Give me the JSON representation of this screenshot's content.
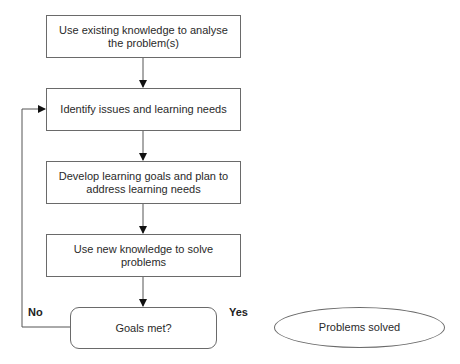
{
  "diagram": {
    "type": "flowchart",
    "nodes": [
      {
        "id": "n1",
        "shape": "rectangle",
        "text": "Use existing knowledge to analyse the problem(s)"
      },
      {
        "id": "n2",
        "shape": "rectangle",
        "text": "Identify issues and learning needs"
      },
      {
        "id": "n3",
        "shape": "rectangle",
        "text": "Develop learning goals and plan to address learning needs"
      },
      {
        "id": "n4",
        "shape": "rectangle",
        "text": "Use new knowledge to solve problems"
      },
      {
        "id": "n5",
        "shape": "rounded-rectangle",
        "text": "Goals met?"
      },
      {
        "id": "n6",
        "shape": "ellipse",
        "text": "Problems solved"
      }
    ],
    "edges": [
      {
        "from": "n1",
        "to": "n2"
      },
      {
        "from": "n2",
        "to": "n3"
      },
      {
        "from": "n3",
        "to": "n4"
      },
      {
        "from": "n4",
        "to": "n5"
      },
      {
        "from": "n5",
        "to": "n2",
        "label": "No"
      },
      {
        "from": "n5",
        "to": "n6",
        "label": "Yes"
      }
    ],
    "labels": {
      "no": "No",
      "yes": "Yes"
    }
  }
}
